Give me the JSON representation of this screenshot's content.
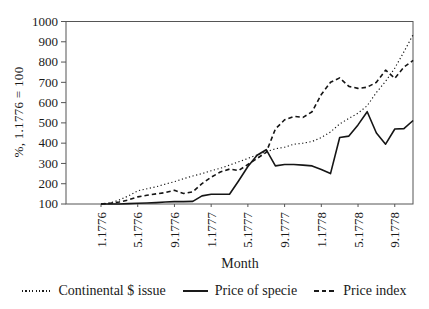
{
  "figure": {
    "background": "#ffffff",
    "text_color": "#1a1a1a",
    "line_color": "#151515",
    "frame_color": "#555555"
  },
  "chart_data": {
    "type": "line",
    "title": "",
    "xlabel": "Month",
    "ylabel": "%, 1.1776 = 100",
    "ylim": [
      100,
      1000
    ],
    "yticks": [
      100,
      200,
      300,
      400,
      500,
      600,
      700,
      800,
      900,
      1000
    ],
    "xticklabels": [
      "1.1776",
      "5.1776",
      "9.1776",
      "1.1777",
      "5.1777",
      "9.1777",
      "1.1778",
      "5.1778",
      "9.1778"
    ],
    "x": [
      "1.1776",
      "2.1776",
      "3.1776",
      "4.1776",
      "5.1776",
      "6.1776",
      "7.1776",
      "8.1776",
      "9.1776",
      "10.1776",
      "11.1776",
      "12.1776",
      "1.1777",
      "2.1777",
      "3.1777",
      "4.1777",
      "5.1777",
      "6.1777",
      "7.1777",
      "8.1777",
      "9.1777",
      "10.1777",
      "11.1777",
      "12.1777",
      "1.1778",
      "2.1778",
      "3.1778",
      "4.1778",
      "5.1778",
      "6.1778",
      "7.1778",
      "8.1778",
      "9.1778",
      "10.1778",
      "11.1778"
    ],
    "grid": false,
    "legend_position": "bottom",
    "series": [
      {
        "name": "Continental $ issue",
        "style": "dotted",
        "values": [
          100,
          105,
          120,
          140,
          165,
          175,
          185,
          198,
          210,
          225,
          238,
          250,
          264,
          276,
          292,
          308,
          325,
          342,
          358,
          372,
          380,
          395,
          400,
          408,
          428,
          455,
          495,
          522,
          548,
          585,
          650,
          705,
          770,
          850,
          935
        ]
      },
      {
        "name": "Price of specie",
        "style": "solid",
        "values": [
          100,
          100,
          100,
          102,
          104,
          105,
          107,
          110,
          112,
          112,
          113,
          140,
          148,
          148,
          148,
          215,
          285,
          340,
          368,
          288,
          295,
          295,
          292,
          288,
          270,
          250,
          428,
          435,
          490,
          555,
          450,
          395,
          470,
          472,
          512
        ]
      },
      {
        "name": "Price index",
        "style": "dashed",
        "values": [
          100,
          104,
          110,
          120,
          135,
          143,
          150,
          156,
          168,
          152,
          160,
          200,
          232,
          258,
          272,
          265,
          295,
          325,
          355,
          470,
          515,
          532,
          527,
          555,
          640,
          700,
          722,
          680,
          670,
          676,
          700,
          760,
          720,
          775,
          808
        ]
      }
    ]
  },
  "legend": {
    "items": [
      {
        "label": "Continental $ issue",
        "style": "dotted"
      },
      {
        "label": "Price of specie",
        "style": "solid"
      },
      {
        "label": "Price index",
        "style": "dashed"
      }
    ]
  }
}
